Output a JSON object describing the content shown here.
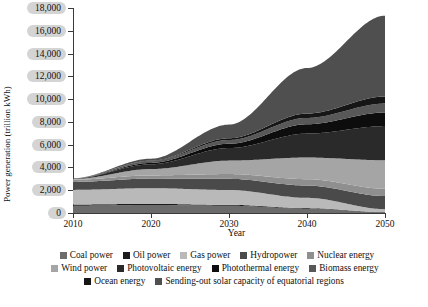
{
  "chart_data": {
    "type": "area",
    "stacked": true,
    "title": "",
    "xlabel": "Year",
    "ylabel": "Power generation (trillion kWh)",
    "x": [
      2010,
      2020,
      2030,
      2040,
      2050
    ],
    "xlim": [
      2010,
      2050
    ],
    "ylim": [
      0,
      18000
    ],
    "yticks": [
      0,
      2000,
      4000,
      6000,
      8000,
      10000,
      12000,
      14000,
      16000,
      18000
    ],
    "ytick_labels": [
      "0",
      "2,000",
      "4,000",
      "6,000",
      "8,000",
      "10,000",
      "12,000",
      "14,000",
      "16,000",
      "18,000"
    ],
    "xticks": [
      2010,
      2020,
      2030,
      2040,
      2050
    ],
    "xtick_labels": [
      "2010",
      "2020",
      "2030",
      "2040",
      "2050"
    ],
    "grid": false,
    "legend_position": "bottom",
    "series": [
      {
        "name": "Coal power",
        "color": "#6b6b6b",
        "values": [
          640,
          700,
          640,
          380,
          60
        ]
      },
      {
        "name": "Oil power",
        "color": "#1c1c1c",
        "values": [
          110,
          100,
          80,
          50,
          20
        ]
      },
      {
        "name": "Gas power",
        "color": "#b9b9b9",
        "values": [
          1280,
          1380,
          1300,
          900,
          260
        ]
      },
      {
        "name": "Hydropower",
        "color": "#4a4a4a",
        "values": [
          700,
          840,
          980,
          1080,
          1150
        ]
      },
      {
        "name": "Nuclear energy",
        "color": "#8f8f8f",
        "values": [
          190,
          280,
          420,
          560,
          640
        ]
      },
      {
        "name": "Wind power",
        "color": "#a5a5a5",
        "values": [
          60,
          560,
          1180,
          1900,
          2500
        ]
      },
      {
        "name": "Photovoltaic energy",
        "color": "#2a2a2a",
        "values": [
          20,
          420,
          1100,
          2100,
          3000
        ]
      },
      {
        "name": "Photothermal energy",
        "color": "#0d0d0d",
        "values": [
          5,
          120,
          380,
          820,
          1200
        ]
      },
      {
        "name": "Biomass energy and others",
        "color": "#585858",
        "values": [
          40,
          150,
          330,
          560,
          780
        ]
      },
      {
        "name": "Ocean energy",
        "color": "#161616",
        "values": [
          2,
          40,
          150,
          380,
          620
        ]
      },
      {
        "name": "Sending-out solar capacity of equatorial regions",
        "color": "#4f4f4f",
        "values": [
          0,
          180,
          1200,
          4000,
          7100
        ]
      }
    ],
    "totals": [
      3047,
      4770,
      7760,
      12730,
      17330
    ],
    "peak_value": 17330,
    "peak_year": 2050
  },
  "legend": {
    "rows": [
      [
        {
          "label": "Coal power",
          "color": "#6b6b6b"
        },
        {
          "label": "Oil power",
          "color": "#1c1c1c"
        },
        {
          "label": "Gas power",
          "color": "#b9b9b9"
        },
        {
          "label": "Hydropower",
          "color": "#4a4a4a"
        },
        {
          "label": "Nuclear energy",
          "color": "#8f8f8f"
        }
      ],
      [
        {
          "label": "Wind power",
          "color": "#a5a5a5"
        },
        {
          "label": "Photovoltaic energy",
          "color": "#2a2a2a"
        },
        {
          "label": "Photothermal energy",
          "color": "#0d0d0d"
        },
        {
          "label": "Biomass energy",
          "color": "#585858"
        }
      ],
      [
        {
          "label": "Ocean energy",
          "color": "#161616"
        },
        {
          "label": "Sending-out solar capacity of equatorial regions",
          "color": "#4f4f4f"
        }
      ]
    ],
    "biomass_wrap": "and others"
  }
}
